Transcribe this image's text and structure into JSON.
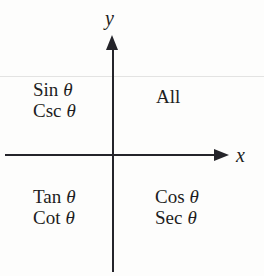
{
  "diagram": {
    "axes": {
      "x_label": "x",
      "y_label": "y",
      "color": "#24242a"
    },
    "background_color": "#fdfdfc",
    "text_color": "#1d1d22",
    "theta_symbol": "θ",
    "quadrants": [
      {
        "id": "quadrant-1",
        "position": "upper-right",
        "lines": [
          "All"
        ]
      },
      {
        "id": "quadrant-2",
        "position": "upper-left",
        "lines": [
          "Sin θ",
          "Csc θ"
        ],
        "functions": [
          "Sin",
          "Csc"
        ]
      },
      {
        "id": "quadrant-3",
        "position": "lower-left",
        "lines": [
          "Tan θ",
          "Cot θ"
        ],
        "functions": [
          "Tan",
          "Cot"
        ]
      },
      {
        "id": "quadrant-4",
        "position": "lower-right",
        "lines": [
          "Cos θ",
          "Sec θ"
        ],
        "functions": [
          "Cos",
          "Sec"
        ]
      }
    ]
  }
}
